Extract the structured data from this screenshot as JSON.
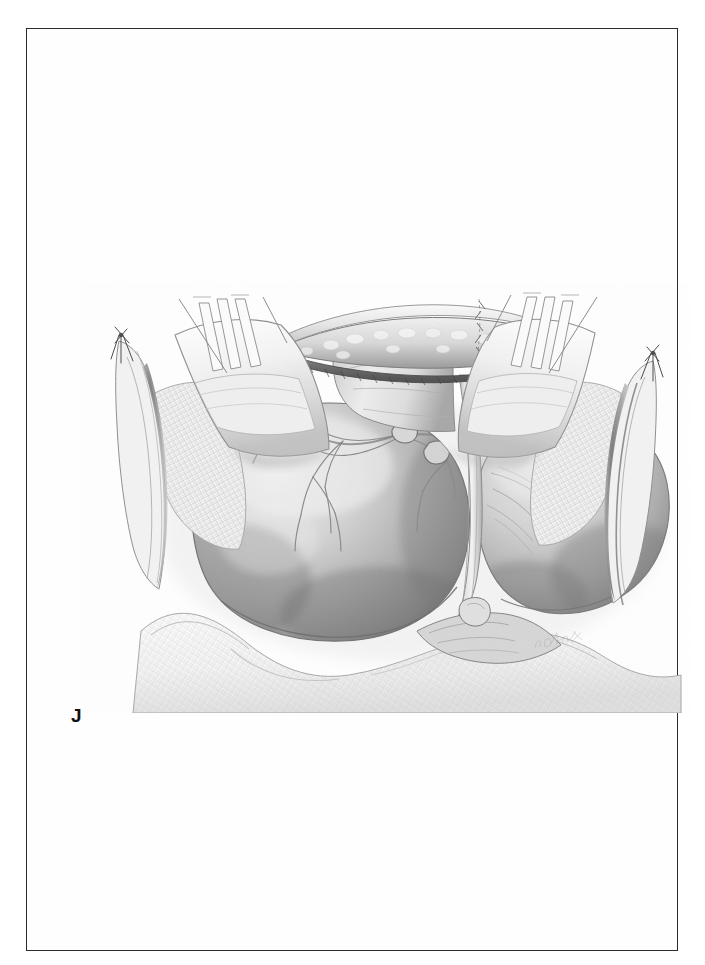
{
  "page": {
    "background_color": "#ffffff",
    "border_color": "#2b2b2b",
    "width": 705,
    "height": 965
  },
  "plate": {
    "label": "J",
    "label_color": "#111111",
    "artist_signature": "A. Clark",
    "signature_visible": true
  },
  "illustration": {
    "medium": "graphite pencil medical illustration",
    "title": "Open surgical exposure with retractors and packed gauze",
    "view": "intraoperative field, superior-to-inferior view",
    "tones": {
      "paper": "#ffffff",
      "lightest_tissue": "#f3f3f3",
      "mid_tissue": "#c9c9c9",
      "deep_shadow": "#5e5e5e",
      "line_work": "#6e6e6e",
      "dark_line": "#3a3a3a"
    },
    "elements": [
      {
        "name": "left-retractor-blade",
        "label": "Left malleable retractor blade",
        "position": "upper left"
      },
      {
        "name": "right-retractor-blade",
        "label": "Right malleable retractor blade",
        "position": "upper right"
      },
      {
        "name": "left-gauze-pack",
        "label": "Left laparotomy gauze pack",
        "position": "left wound margin"
      },
      {
        "name": "right-gauze-pack",
        "label": "Right laparotomy gauze pack",
        "position": "right wound margin"
      },
      {
        "name": "lower-gauze-drape",
        "label": "Inferior gauze drape",
        "position": "bottom of field"
      },
      {
        "name": "incision-edge",
        "label": "Incised fascial edge with subcutaneous fat",
        "position": "top center"
      },
      {
        "name": "left-organ-lobe",
        "label": "Left organ lobe with branching vasculature",
        "position": "center left"
      },
      {
        "name": "right-organ-lobe",
        "label": "Right organ lobe",
        "position": "center right"
      },
      {
        "name": "midline-fissure",
        "label": "Midline fissure / falciform attachment",
        "position": "center"
      },
      {
        "name": "left-stay-suture",
        "label": "Left stay suture knot",
        "position": "far upper left"
      },
      {
        "name": "right-stay-suture",
        "label": "Right stay suture knot",
        "position": "far upper right"
      },
      {
        "name": "vascular-tree",
        "label": "Branching surface vessels on left lobe",
        "position": "upper face of left lobe"
      }
    ]
  }
}
